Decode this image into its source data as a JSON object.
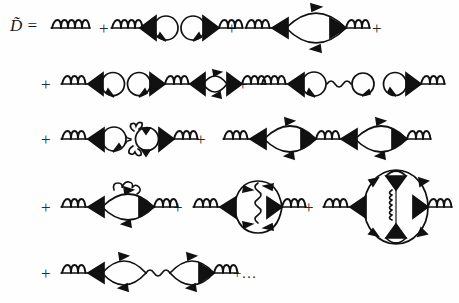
{
  "equation": {
    "lhs_symbol": "D̃",
    "equals_sign": "=",
    "lhs_text": "D̃ =",
    "plus_sign": "+",
    "ellipsis": "+…",
    "ink_color": "#111111",
    "background_color": "#fefefe"
  },
  "legend": {
    "coil_name": "gluon-propagator-coil",
    "wavy_name": "photon-propagator-wavy",
    "loop_name": "fermion-loop",
    "vertex_name": "filled-triangle-vertex"
  },
  "rows": [
    {
      "id": "row-1",
      "terms": [
        {
          "id": "term-bare-propagator",
          "label": "bare gluon propagator",
          "operator": ""
        },
        {
          "id": "term-double-tadpole",
          "label": "two tadpole loops with vertices",
          "operator": "+"
        },
        {
          "id": "term-one-loop-bubble",
          "label": "single fermion bubble",
          "operator": "+"
        }
      ],
      "trailing_operator": "+"
    },
    {
      "id": "row-2",
      "terms": [
        {
          "id": "term-tadpole-tadpole-bubble",
          "label": "tadpole, tadpole, and dressed bubble chain",
          "operator": "+"
        },
        {
          "id": "term-tadpole-wavy-loop-tadpole",
          "label": "tadpole joined by wavy line to loop and tadpole",
          "operator": "+"
        }
      ],
      "trailing_operator": ""
    },
    {
      "id": "row-3",
      "terms": [
        {
          "id": "term-tadpole-coiled-loop",
          "label": "tadpole and coil-wrapped loop",
          "operator": "+"
        },
        {
          "id": "term-two-bubble-chain",
          "label": "two fermion bubbles in series",
          "operator": "+"
        }
      ],
      "trailing_operator": ""
    },
    {
      "id": "row-4",
      "terms": [
        {
          "id": "term-bubble-with-self-energy-coil",
          "label": "bubble with coil self-energy insertion on top",
          "operator": "+"
        },
        {
          "id": "term-vertex-correction-bubble",
          "label": "bubble with internal vertical wavy exchange",
          "operator": "+"
        },
        {
          "id": "term-large-oval-with-internal-coil",
          "label": "large oval with internal vertical coil and two loops",
          "operator": "+"
        }
      ],
      "trailing_operator": ""
    },
    {
      "id": "row-5",
      "terms": [
        {
          "id": "term-two-bubbles-wavy-link",
          "label": "two fermion bubbles linked by wavy line",
          "operator": "+"
        }
      ],
      "trailing_operator": "+…"
    }
  ]
}
